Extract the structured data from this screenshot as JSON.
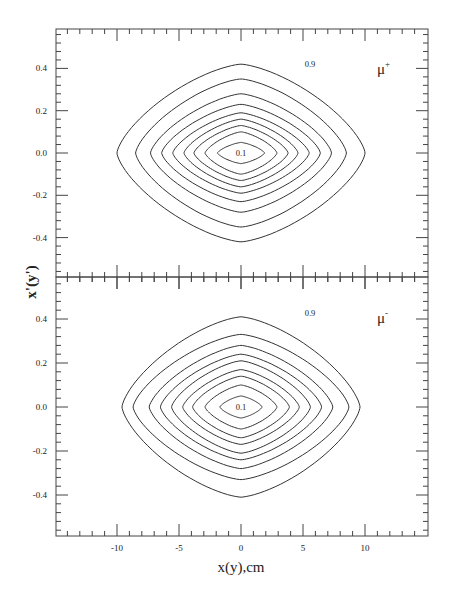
{
  "chart_data": {
    "type": "contour",
    "layout": "two vertically stacked panels sharing x axis",
    "xlabel": "x(y),cm",
    "ylabel": "x'(y')",
    "xlim": [
      -15,
      15
    ],
    "ylim": [
      -0.59,
      0.59
    ],
    "x_major_ticks": [
      -10,
      -5,
      0,
      5,
      10
    ],
    "x_minor_step": 1,
    "y_major_ticks": [
      0.4,
      0.2,
      0.0,
      -0.2,
      -0.4
    ],
    "y_tick_labels": [
      "0.4",
      "0.2",
      "0.0",
      "-0.2",
      "-0.4"
    ],
    "x_tick_labels": [
      "-10",
      "-5",
      "0",
      "5",
      "10"
    ],
    "y_minor_step": 0.04,
    "grid": false,
    "contour_levels": [
      0.1,
      0.2,
      0.3,
      0.4,
      0.5,
      0.6,
      0.7,
      0.8,
      0.9
    ],
    "panels": [
      {
        "name": "mu-plus",
        "label": "μ",
        "label_sup": "+",
        "inner_level_label": "0.1",
        "outer_level_label": "0.9",
        "contours": [
          {
            "level": 0.1,
            "half_width_cm": 1.9,
            "half_height": 0.05
          },
          {
            "level": 0.2,
            "half_width_cm": 2.9,
            "half_height": 0.1
          },
          {
            "level": 0.3,
            "half_width_cm": 3.8,
            "half_height": 0.13
          },
          {
            "level": 0.4,
            "half_width_cm": 4.6,
            "half_height": 0.16
          },
          {
            "level": 0.5,
            "half_width_cm": 5.5,
            "half_height": 0.19
          },
          {
            "level": 0.6,
            "half_width_cm": 6.4,
            "half_height": 0.23
          },
          {
            "level": 0.7,
            "half_width_cm": 7.3,
            "half_height": 0.28
          },
          {
            "level": 0.8,
            "half_width_cm": 8.5,
            "half_height": 0.35
          },
          {
            "level": 0.9,
            "half_width_cm": 10.0,
            "half_height": 0.42
          }
        ]
      },
      {
        "name": "mu-minus",
        "label": "μ",
        "label_sup": "-",
        "inner_level_label": "0.1",
        "outer_level_label": "0.9",
        "contours": [
          {
            "level": 0.1,
            "half_width_cm": 1.7,
            "half_height": 0.05
          },
          {
            "level": 0.2,
            "half_width_cm": 2.9,
            "half_height": 0.1
          },
          {
            "level": 0.3,
            "half_width_cm": 3.9,
            "half_height": 0.14
          },
          {
            "level": 0.4,
            "half_width_cm": 4.7,
            "half_height": 0.17
          },
          {
            "level": 0.5,
            "half_width_cm": 5.6,
            "half_height": 0.21
          },
          {
            "level": 0.6,
            "half_width_cm": 6.5,
            "half_height": 0.24
          },
          {
            "level": 0.7,
            "half_width_cm": 7.4,
            "half_height": 0.28
          },
          {
            "level": 0.8,
            "half_width_cm": 8.7,
            "half_height": 0.33
          },
          {
            "level": 0.9,
            "half_width_cm": 9.6,
            "half_height": 0.41
          }
        ]
      }
    ]
  },
  "colors": {
    "line": "#333333",
    "frame": "#444444",
    "background": "#ffffff"
  }
}
